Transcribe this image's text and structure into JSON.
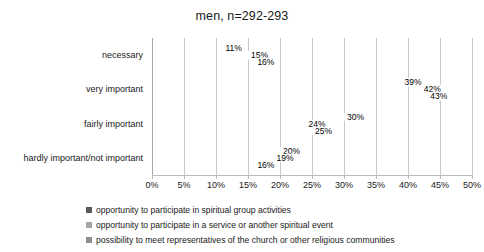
{
  "chart_data": {
    "type": "bar",
    "orientation": "horizontal",
    "title": "men, n=292-293",
    "xlabel": "",
    "ylabel": "",
    "xlim": [
      0,
      50
    ],
    "xtick_labels": [
      "0%",
      "5%",
      "10%",
      "15%",
      "20%",
      "25%",
      "30%",
      "35%",
      "40%",
      "45%",
      "50%"
    ],
    "xtick_values": [
      0,
      5,
      10,
      15,
      20,
      25,
      30,
      35,
      40,
      45,
      50
    ],
    "grid": true,
    "legend_position": "bottom",
    "categories": [
      "necessary",
      "very important",
      "fairly important",
      "hardly important/not important"
    ],
    "series": [
      {
        "name": "opportunity to participate in spiritual group activities",
        "color": "#595959",
        "values": [
          11,
          39,
          30,
          20
        ],
        "labels": [
          "11%",
          "39%",
          "30%",
          "20%"
        ]
      },
      {
        "name": "opportunity to participate in a service or another spiritual event",
        "color": "#a6a6a6",
        "values": [
          15,
          42,
          24,
          19
        ],
        "labels": [
          "15%",
          "42%",
          "24%",
          "19%"
        ]
      },
      {
        "name": "possibility to meet representatives of the church or other religious communities",
        "color": "#8c8c8c",
        "values": [
          16,
          43,
          25,
          16
        ],
        "labels": [
          "16%",
          "43%",
          "25%",
          "16%"
        ]
      }
    ]
  }
}
